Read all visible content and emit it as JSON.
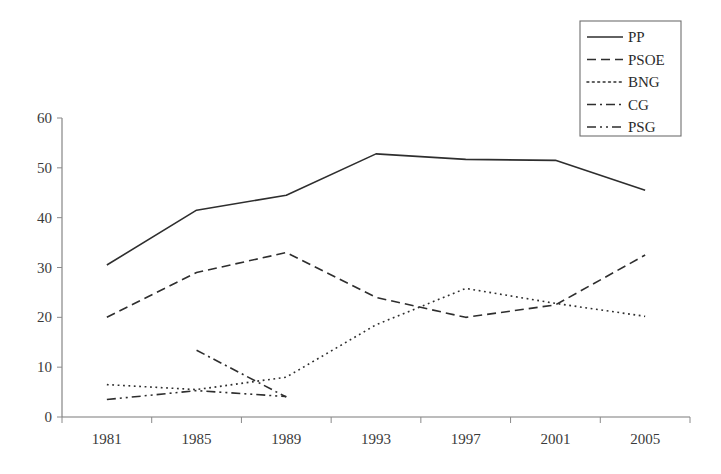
{
  "chart_data": {
    "type": "line",
    "title": "",
    "xlabel": "",
    "ylabel": "",
    "categories": [
      "1981",
      "1985",
      "1989",
      "1993",
      "1997",
      "2001",
      "2005"
    ],
    "ylim": [
      0,
      60
    ],
    "yticks": [
      0,
      10,
      20,
      30,
      40,
      50,
      60
    ],
    "grid": false,
    "legend_position": "top-right",
    "series": [
      {
        "name": "PP",
        "style": "solid",
        "values": [
          30.5,
          41.5,
          44.5,
          52.8,
          51.7,
          51.5,
          45.5
        ]
      },
      {
        "name": "PSOE",
        "style": "dashed",
        "values": [
          20.0,
          29.0,
          33.0,
          24.0,
          20.0,
          22.5,
          32.5
        ]
      },
      {
        "name": "BNG",
        "style": "dotted",
        "values": [
          6.5,
          5.5,
          8.0,
          18.5,
          25.8,
          22.8,
          20.2
        ]
      },
      {
        "name": "CG",
        "style": "dash-dot",
        "values": [
          null,
          13.4,
          4.0,
          null,
          null,
          null,
          null
        ]
      },
      {
        "name": "PSG",
        "style": "dash-dot-dot",
        "values": [
          3.5,
          5.3,
          4.1,
          null,
          null,
          null,
          null
        ]
      }
    ]
  },
  "axes": {
    "y_tick_labels": [
      "0",
      "10",
      "20",
      "30",
      "40",
      "50",
      "60"
    ],
    "x_tick_labels": [
      "1981",
      "1985",
      "1989",
      "1993",
      "1997",
      "2001",
      "2005"
    ]
  },
  "legend": {
    "entries": [
      {
        "label": "PP",
        "icon": "solid-line-icon"
      },
      {
        "label": "PSOE",
        "icon": "dashed-line-icon"
      },
      {
        "label": "BNG",
        "icon": "dotted-line-icon"
      },
      {
        "label": "CG",
        "icon": "dash-dot-line-icon"
      },
      {
        "label": "PSG",
        "icon": "dash-dot-dot-line-icon"
      }
    ]
  },
  "colors": {
    "line": "#2e2e2e",
    "axis": "#7a7a7a",
    "text": "#2b2b2b",
    "background": "#ffffff"
  }
}
